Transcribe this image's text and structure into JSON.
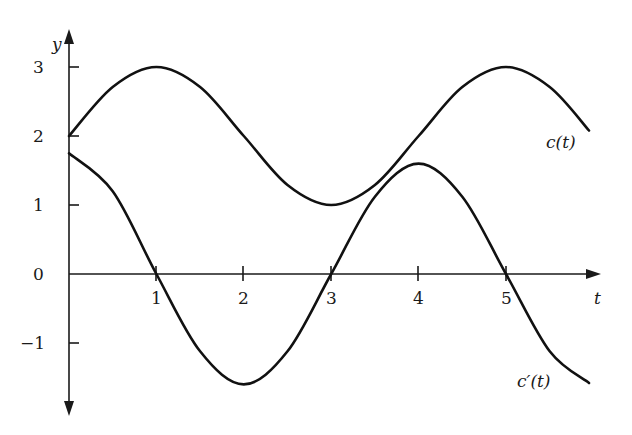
{
  "chart_data": {
    "type": "line",
    "title": "",
    "xlabel": "t",
    "ylabel": "y",
    "xlim": [
      0,
      6
    ],
    "ylim": [
      -1.9,
      3.5
    ],
    "grid": false,
    "legend": "inline labels at right end of curves",
    "x_ticks": [
      1,
      2,
      3,
      4,
      5
    ],
    "x_tick_labels": [
      "1",
      "2",
      "3",
      "4",
      "5"
    ],
    "y_ticks": [
      3,
      2,
      1,
      0,
      -1
    ],
    "y_tick_labels": [
      "3",
      "2",
      "1",
      "0",
      "−1"
    ],
    "series": [
      {
        "name": "c(t)",
        "label": "c(t)",
        "description": "periodic curve oscillating between 1 and 3",
        "x": [
          0,
          0.5,
          1,
          1.5,
          2,
          2.5,
          3,
          3.5,
          4,
          4.5,
          5,
          5.5,
          5.95
        ],
        "values": [
          2,
          2.71,
          3,
          2.71,
          2,
          1.29,
          1,
          1.29,
          2,
          2.71,
          3,
          2.71,
          2.08
        ]
      },
      {
        "name": "c'(t)",
        "label": "c′(t)",
        "description": "derivative of c(t), zero at t = 1, 3, 5",
        "x": [
          0,
          0.5,
          1,
          1.5,
          2,
          2.5,
          3,
          3.5,
          4,
          4.5,
          5,
          5.5,
          5.95
        ],
        "values": [
          1.75,
          1.2,
          0,
          -1.12,
          -1.6,
          -1.12,
          0,
          1.12,
          1.6,
          1.12,
          0,
          -1.12,
          -1.58
        ]
      }
    ],
    "annotations": [
      {
        "text": "c(t)",
        "near": "right end of upper curve"
      },
      {
        "text": "c′(t)",
        "near": "right end of lower curve"
      }
    ]
  },
  "labels": {
    "y_axis": "y",
    "x_axis": "t",
    "c_curve": "c(t)",
    "c_prime_curve": "c′(t)",
    "yt3": "3",
    "yt2": "2",
    "yt1": "1",
    "yt0": "0",
    "ytm1": "−1",
    "xt1": "1",
    "xt2": "2",
    "xt3": "3",
    "xt4": "4",
    "xt5": "5"
  }
}
